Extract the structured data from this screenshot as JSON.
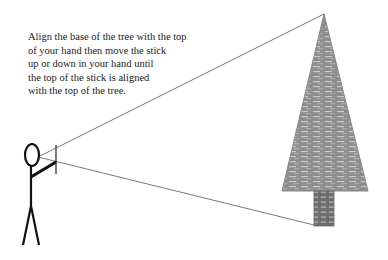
{
  "caption": {
    "lines": [
      "Align the base of the tree with the top",
      "of your hand then move the stick",
      "up or down in your hand until",
      "the top of the stick is aligned",
      "with the top of the tree."
    ]
  },
  "figure": {
    "person": "stick-figure",
    "object": "tree",
    "sight_lines": 2
  },
  "colors": {
    "line": "#555555",
    "figure": "#111111",
    "tree": "#8c8c8c",
    "trunk": "#707070"
  }
}
